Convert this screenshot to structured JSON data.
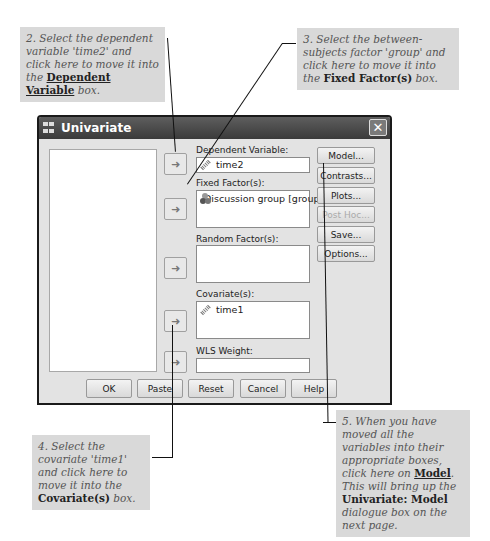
{
  "callouts": {
    "step2": {
      "pre": "2. Select the dependent variable 'time2' and click here to move it into the ",
      "bold": "Dependent Variable",
      "post": " box."
    },
    "step3": {
      "pre": "3. Select the between-subjects factor 'group' and click here to move it into the ",
      "bold": "Fixed Factor(s)",
      "post": " box."
    },
    "step4": {
      "pre": "4. Select the covariate 'time1' and click here to move it into the ",
      "bold": "Covariate(s)",
      "post": " box."
    },
    "step5": {
      "pre": "5. When you have moved all the variables into their appropriate boxes, click here on ",
      "bold": "Model",
      "mid": ". This will bring up the ",
      "bold2": "Univariate: Model",
      "post": " dialogue box on the next page."
    }
  },
  "dialog": {
    "title": "Univariate",
    "close_icon": "close-icon",
    "arrow_glyph": "➜",
    "labels": {
      "dependent": "Dependent Variable:",
      "fixed": "Fixed Factor(s):",
      "random": "Random Factor(s):",
      "covariates": "Covariate(s):",
      "wls": "WLS Weight:"
    },
    "values": {
      "dependent": "time2",
      "fixed": [
        "Discussion group [group]"
      ],
      "random": [],
      "covariates": [
        "time1"
      ],
      "wls": ""
    },
    "side_buttons": [
      {
        "label": "Model...",
        "enabled": true
      },
      {
        "label": "Contrasts...",
        "enabled": true
      },
      {
        "label": "Plots...",
        "enabled": true
      },
      {
        "label": "Post Hoc...",
        "enabled": false
      },
      {
        "label": "Save...",
        "enabled": true
      },
      {
        "label": "Options...",
        "enabled": true
      }
    ],
    "bottom_buttons": [
      "OK",
      "Paste",
      "Reset",
      "Cancel",
      "Help"
    ]
  }
}
